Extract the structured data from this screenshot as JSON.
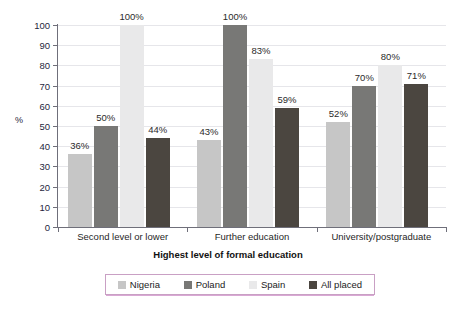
{
  "chart_data": {
    "type": "bar",
    "title": "",
    "subtitle": "",
    "xlabel": "Highest level of formal education",
    "ylabel": "%",
    "ylim": [
      0,
      100
    ],
    "yticks": [
      0,
      10,
      20,
      30,
      40,
      50,
      60,
      70,
      80,
      90,
      100
    ],
    "ytick_labels": [
      "0",
      "10",
      "20",
      "30",
      "40",
      "50",
      "60",
      "70",
      "80",
      "90",
      "100"
    ],
    "grid": true,
    "legend_position": "bottom",
    "categories": [
      "Second level or lower",
      "Further education",
      "University/postgraduate"
    ],
    "series": [
      {
        "name": "Nigeria",
        "color": "#c6c6c6",
        "values": [
          36,
          43,
          52
        ],
        "labels": [
          "36%",
          "43%",
          "52%"
        ]
      },
      {
        "name": "Poland",
        "color": "#787876",
        "values": [
          50,
          100,
          70
        ],
        "labels": [
          "50%",
          "100%",
          "70%"
        ]
      },
      {
        "name": "Spain",
        "color": "#e9e9ea",
        "values": [
          100,
          83,
          80
        ],
        "labels": [
          "100%",
          "83%",
          "80%"
        ]
      },
      {
        "name": "All placed",
        "color": "#4b4640",
        "values": [
          44,
          59,
          71
        ],
        "labels": [
          "44%",
          "59%",
          "71%"
        ]
      }
    ]
  },
  "legend": {
    "items": [
      {
        "label": "Nigeria",
        "color": "#c6c6c6"
      },
      {
        "label": "Poland",
        "color": "#787876"
      },
      {
        "label": "Spain",
        "color": "#e9e9ea"
      },
      {
        "label": "All placed",
        "color": "#4b4640"
      }
    ],
    "border_color": "#c9a0c4"
  },
  "axes": {
    "y_title": "%",
    "x_title": "Highest level of formal education"
  }
}
